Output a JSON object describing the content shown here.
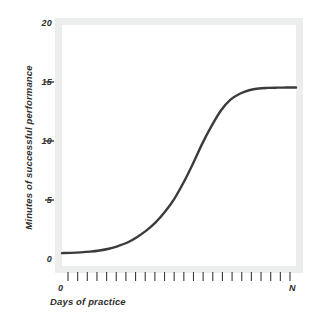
{
  "chart_data": {
    "type": "line",
    "title": "",
    "subtitle": "",
    "xlabel": "Days of practice",
    "ylabel": "Minutes of successful performance",
    "xlim": [
      0,
      25
    ],
    "ylim": [
      0,
      20
    ],
    "grid": false,
    "legend": null,
    "x_tick_labels": [
      "0",
      "N"
    ],
    "x_tick_count": 24,
    "y_tick_labels": [
      "0",
      "5",
      "10",
      "15",
      "20"
    ],
    "y_tick_values": [
      0,
      5,
      10,
      15,
      20
    ],
    "series": [
      {
        "name": "Learning curve",
        "color": "#3b3b3b",
        "x": [
          0,
          1,
          2,
          3,
          4,
          5,
          6,
          7,
          8,
          9,
          10,
          11,
          12,
          13,
          14,
          15,
          16,
          17,
          18,
          19,
          20,
          21,
          22,
          23,
          24,
          25
        ],
        "values": [
          0.5,
          0.52,
          0.56,
          0.62,
          0.72,
          0.87,
          1.1,
          1.4,
          1.85,
          2.4,
          3.1,
          4.0,
          5.1,
          6.5,
          8.1,
          9.8,
          11.3,
          12.6,
          13.5,
          14.0,
          14.3,
          14.45,
          14.5,
          14.52,
          14.53,
          14.54
        ]
      }
    ],
    "annotations": []
  },
  "axes": {
    "y_ticks": [
      {
        "label": "20",
        "value": 20,
        "has_dash": false
      },
      {
        "label": "15",
        "value": 15,
        "has_dash": true
      },
      {
        "label": "10",
        "value": 10,
        "has_dash": true
      },
      {
        "label": "5",
        "value": 5,
        "has_dash": true
      },
      {
        "label": "0",
        "value": 0,
        "has_dash": false
      }
    ],
    "y_title": "Minutes of successful performance",
    "x_title": "Days of practice",
    "x_start_label": "0",
    "x_end_label": "N"
  },
  "colors": {
    "curve": "#3b3b3b",
    "frame_band": "#eceded",
    "plot_background": "#ffffff",
    "text": "#2e2e2e",
    "page_background": "#ffffff"
  }
}
